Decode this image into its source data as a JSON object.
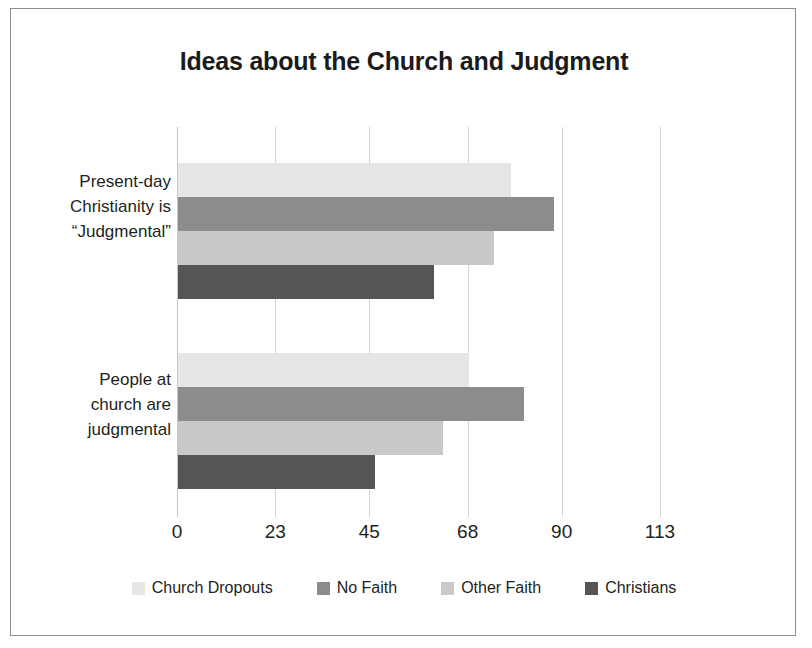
{
  "chart_data": {
    "type": "bar",
    "orientation": "horizontal",
    "title": "Ideas about the Church and Judgment",
    "xlabel": "",
    "ylabel": "",
    "xlim": [
      0,
      113
    ],
    "xticks": [
      0,
      23,
      45,
      68,
      90,
      113
    ],
    "xtick_labels": [
      "0",
      "23",
      "45",
      "68",
      "90",
      "113"
    ],
    "grid": true,
    "legend_position": "bottom",
    "categories": [
      "Present-day Christianity is “Judgmental”",
      "People at church are judgmental"
    ],
    "category_lines": [
      [
        "Present-day",
        "Christianity is",
        "“Judgmental”"
      ],
      [
        "People at",
        "church are",
        "judgmental"
      ]
    ],
    "series": [
      {
        "name": "Church Dropouts",
        "color": "#e6e6e6",
        "values": [
          78,
          68
        ]
      },
      {
        "name": "No Faith",
        "color": "#8c8c8c",
        "values": [
          88,
          81
        ]
      },
      {
        "name": "Other Faith",
        "color": "#c9c9c9",
        "values": [
          74,
          62
        ]
      },
      {
        "name": "Christians",
        "color": "#555555",
        "values": [
          60,
          46
        ]
      }
    ]
  },
  "frame": {
    "border_color": "#8d8d8d",
    "background": "#ffffff"
  },
  "axis": {
    "gridline_color": "#d4d4d4",
    "axis_line_color": "#c6c6c6"
  }
}
